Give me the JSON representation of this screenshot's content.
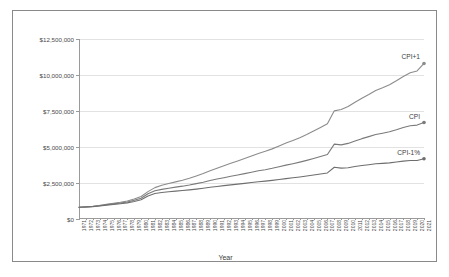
{
  "chart_data": {
    "type": "line",
    "title": "",
    "xlabel": "Year",
    "ylabel": "",
    "ylim": [
      0,
      12500000
    ],
    "ytick_labels": [
      "$0",
      "$2,500,000",
      "$5,000,000",
      "$7,500,000",
      "$10,000,000",
      "$12,500,000"
    ],
    "ytick_values": [
      0,
      2500000,
      5000000,
      7500000,
      10000000,
      12500000
    ],
    "grid": true,
    "legend_position": "inline-right-of-series",
    "categories": [
      "1971",
      "1972",
      "1973",
      "1974",
      "1975",
      "1976",
      "1977",
      "1978",
      "1979",
      "1980",
      "1981",
      "1982",
      "1983",
      "1984",
      "1985",
      "1986",
      "1987",
      "1988",
      "1989",
      "1990",
      "1991",
      "1992",
      "1993",
      "1994",
      "1995",
      "1996",
      "1997",
      "1998",
      "1999",
      "2000",
      "2001",
      "2002",
      "2003",
      "2004",
      "2005",
      "2006",
      "2007",
      "2008",
      "2009",
      "2010",
      "2011",
      "2012",
      "2013",
      "2014",
      "2015",
      "2016",
      "2017",
      "2018",
      "2019",
      "2020",
      "2021"
    ],
    "series": [
      {
        "name": "CPI+1",
        "color": "#8c8c8c",
        "end_marker": true,
        "values": [
          820000,
          845000,
          880000,
          945000,
          1030000,
          1095000,
          1165000,
          1255000,
          1390000,
          1560000,
          1900000,
          2180000,
          2340000,
          2460000,
          2580000,
          2690000,
          2830000,
          2990000,
          3160000,
          3350000,
          3530000,
          3700000,
          3870000,
          4030000,
          4200000,
          4380000,
          4550000,
          4700000,
          4870000,
          5070000,
          5270000,
          5450000,
          5650000,
          5870000,
          6110000,
          6360000,
          6620000,
          7510000,
          7600000,
          7810000,
          8110000,
          8390000,
          8650000,
          8930000,
          9120000,
          9330000,
          9600000,
          9900000,
          10150000,
          10280000,
          10800000
        ]
      },
      {
        "name": "CPI",
        "color": "#7a7a7a",
        "end_marker": true,
        "values": [
          820000,
          840000,
          870000,
          925000,
          995000,
          1050000,
          1110000,
          1185000,
          1300000,
          1445000,
          1750000,
          1960000,
          2060000,
          2140000,
          2215000,
          2280000,
          2360000,
          2455000,
          2555000,
          2670000,
          2775000,
          2870000,
          2965000,
          3055000,
          3150000,
          3250000,
          3345000,
          3425000,
          3520000,
          3630000,
          3740000,
          3840000,
          3950000,
          4070000,
          4200000,
          4335000,
          4475000,
          5200000,
          5150000,
          5250000,
          5420000,
          5580000,
          5720000,
          5870000,
          5960000,
          6060000,
          6200000,
          6360000,
          6480000,
          6520000,
          6700000
        ]
      },
      {
        "name": "CPI-1%",
        "color": "#6e6e6e",
        "end_marker": true,
        "values": [
          820000,
          835000,
          860000,
          905000,
          965000,
          1010000,
          1060000,
          1120000,
          1215000,
          1335000,
          1600000,
          1770000,
          1840000,
          1890000,
          1935000,
          1975000,
          2020000,
          2075000,
          2135000,
          2200000,
          2260000,
          2315000,
          2370000,
          2420000,
          2475000,
          2530000,
          2585000,
          2630000,
          2685000,
          2745000,
          2805000,
          2860000,
          2920000,
          2985000,
          3055000,
          3125000,
          3200000,
          3590000,
          3530000,
          3560000,
          3640000,
          3710000,
          3770000,
          3835000,
          3865000,
          3900000,
          3955000,
          4020000,
          4065000,
          4060000,
          4180000
        ]
      }
    ]
  }
}
